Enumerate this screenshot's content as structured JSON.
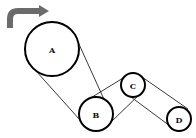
{
  "diagram": {
    "type": "belt-pulley-system",
    "rotation_arrow": {
      "icon": "curved-arrow-right-icon",
      "direction": "clockwise",
      "color": "#6b6b6b"
    },
    "pulleys": [
      {
        "label": "A",
        "cx": 52,
        "cy": 49,
        "r": 27
      },
      {
        "label": "B",
        "cx": 96,
        "cy": 114,
        "r": 17
      },
      {
        "label": "C",
        "cx": 133,
        "cy": 85,
        "r": 12
      },
      {
        "label": "D",
        "cx": 179,
        "cy": 119,
        "r": 12
      }
    ],
    "belts": [
      {
        "from": "A",
        "to": "B",
        "type": "open",
        "segments": [
          [
            36,
            71,
            80,
            120
          ],
          [
            78,
            42,
            107,
            106
          ]
        ]
      },
      {
        "from": "B",
        "to": "C",
        "type": "crossed",
        "segments": [
          [
            91,
            99,
            127,
            75
          ],
          [
            112,
            121,
            139,
            95
          ]
        ]
      },
      {
        "from": "C",
        "to": "D",
        "type": "open",
        "segments": [
          [
            143,
            78,
            188,
            109
          ],
          [
            132,
            97,
            170,
            127
          ]
        ]
      }
    ]
  }
}
